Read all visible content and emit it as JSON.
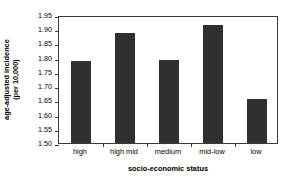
{
  "chart_data": {
    "type": "bar",
    "title": "",
    "subtitle": "",
    "categories": [
      "high",
      "high mid",
      "medium",
      "mid-low",
      "low"
    ],
    "values": [
      1.787,
      1.888,
      1.791,
      1.916,
      1.655
    ],
    "xlabel": "socio-economic status",
    "ylabel_lines": [
      "age-adjusted incidence",
      "(per 10,000)"
    ],
    "ylabel": "age-adjusted incidence (per 10,000)",
    "ylim": [
      1.5,
      1.95
    ],
    "yticks": [
      1.5,
      1.55,
      1.6,
      1.65,
      1.7,
      1.75,
      1.8,
      1.85,
      1.9,
      1.95
    ],
    "ytick_labels": [
      "1.50",
      "1.55",
      "1.60",
      "1.65",
      "1.70",
      "1.75",
      "1.80",
      "1.85",
      "1.90",
      "1.95"
    ],
    "grid": false,
    "legend": null,
    "legend_position": "none",
    "bar_color": "#303030",
    "axis_color": "#3a3a3a",
    "background_color": "#ffffff",
    "annotations": []
  }
}
